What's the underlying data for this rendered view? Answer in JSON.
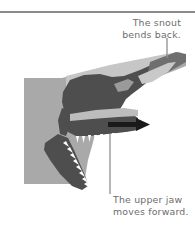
{
  "figure": {
    "divider": {
      "name": "top-horizontal-rule",
      "color": "#8a8a8a"
    }
  },
  "annotations": [
    {
      "id": "snout-callout",
      "text": "The snout\nbends back.",
      "line1": "The snout",
      "line2": "bends back.",
      "align": "right",
      "leader": {
        "x": 167,
        "y_top": 38,
        "y_bottom": 58,
        "color": "#8e8e8e"
      }
    },
    {
      "id": "upper-jaw-callout",
      "text": "The upper jaw\nmoves forward.",
      "line1": "The upper jaw",
      "line2": "moves forward.",
      "align": "left",
      "leader": {
        "x": 110,
        "y_top": 134,
        "y_bottom": 194,
        "color": "#8e8e8e"
      }
    }
  ],
  "arrow": {
    "name": "forward-motion-arrow",
    "direction": "right",
    "color": "#1a1a1a"
  },
  "palette": {
    "body_gray": "#a9a9a9",
    "bone_dark": "#4e4e4e",
    "bone_mid": "#7d7d7d",
    "highlight_light": "#c9c9c9",
    "teeth_white": "#ffffff",
    "text_gray": "#6d6d6d",
    "rule_gray": "#8a8a8a",
    "background": "#ffffff"
  },
  "anatomy_parts": [
    {
      "name": "neck-body-silhouette",
      "tone": "body_gray"
    },
    {
      "name": "upper-skull-bone",
      "tone": "bone_dark"
    },
    {
      "name": "snout-tip",
      "tone": "bone_mid"
    },
    {
      "name": "antorbital-fenestra",
      "tone": "highlight_light"
    },
    {
      "name": "upper-jaw-tooth-row",
      "tone": "teeth_white"
    },
    {
      "name": "lower-jaw-mandible",
      "tone": "bone_dark"
    },
    {
      "name": "lower-jaw-tooth-row",
      "tone": "teeth_white"
    }
  ]
}
